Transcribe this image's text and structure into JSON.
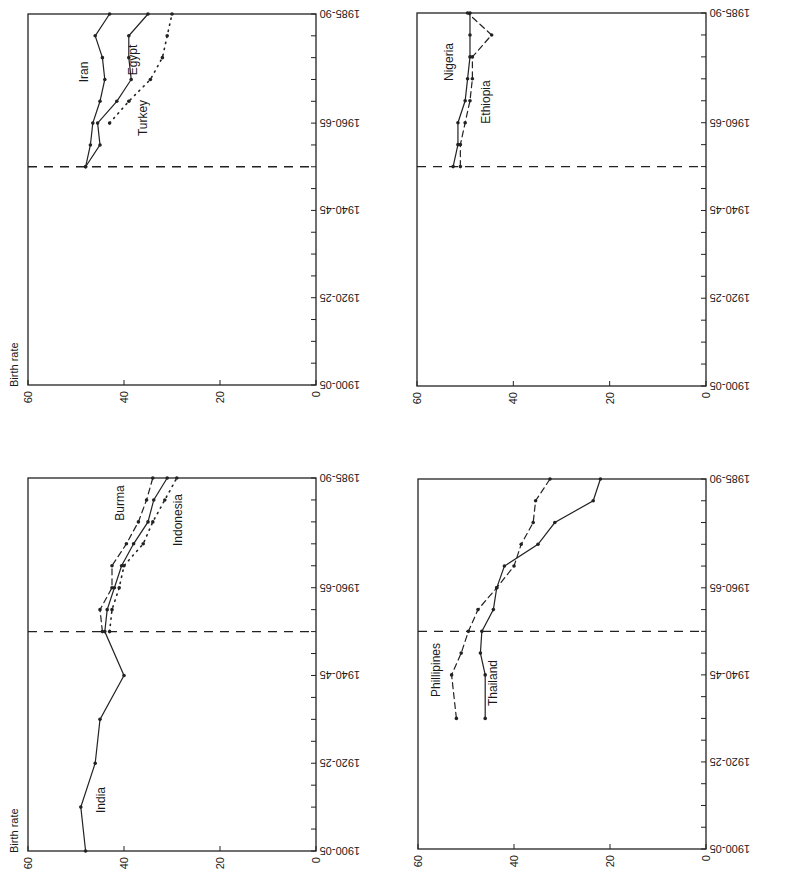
{
  "figure": {
    "orientation": "rotated 90deg (time axis vertical, 1985-90 at top; birth rate horizontal, 60 at left, 0 at right)",
    "ylabel": "Birth rate"
  },
  "chart_data": [
    {
      "type": "line",
      "panel": "top-left",
      "title": "",
      "xlabel": "",
      "ylabel": "Birth rate",
      "ylim": [
        0,
        60
      ],
      "yticks": [
        0,
        20,
        40,
        60
      ],
      "x_tick_labels": [
        "1900-05",
        "1920-25",
        "1940-45",
        "1960-65",
        "1985-90"
      ],
      "x": [
        "1900-05",
        "1905-10",
        "1910-15",
        "1915-20",
        "1920-25",
        "1925-30",
        "1930-35",
        "1935-40",
        "1940-45",
        "1945-50",
        "1950-55",
        "1955-60",
        "1960-65",
        "1965-70",
        "1970-75",
        "1975-80",
        "1980-85",
        "1985-90"
      ],
      "reference_line": "1950-55",
      "grid": false,
      "series": [
        {
          "name": "Iran",
          "style": "solid",
          "start": "1950-55",
          "values": [
            48,
            47,
            46.5,
            45,
            44,
            44.5,
            46,
            43
          ]
        },
        {
          "name": "Egypt",
          "style": "solid",
          "start": "1950-55",
          "values": [
            48,
            45,
            45.5,
            41.5,
            38.5,
            39,
            39,
            35
          ]
        },
        {
          "name": "Turkey",
          "style": "dotted",
          "start": "1960-65",
          "values": [
            43,
            39,
            34.5,
            32,
            31,
            30
          ]
        }
      ],
      "annotations": [
        {
          "text": "Iran"
        },
        {
          "text": "Egypt"
        },
        {
          "text": "Turkey"
        }
      ]
    },
    {
      "type": "line",
      "panel": "top-right",
      "title": "",
      "ylabel": "",
      "ylim": [
        0,
        60
      ],
      "yticks": [
        0,
        20,
        40,
        60
      ],
      "x_tick_labels": [
        "1900-05",
        "1920-25",
        "1940-45",
        "1960-65",
        "1985-90"
      ],
      "reference_line": "1950-55",
      "grid": false,
      "series": [
        {
          "name": "Nigeria",
          "style": "solid",
          "start": "1950-55",
          "values": [
            52.5,
            51.5,
            51.5,
            50,
            49.5,
            49,
            49,
            49
          ]
        },
        {
          "name": "Ethiopia",
          "style": "dashed",
          "start": "1950-55",
          "values": [
            51,
            51,
            50,
            49,
            48.5,
            48.5,
            44.5,
            49.5
          ]
        }
      ],
      "annotations": [
        {
          "text": "Nigeria"
        },
        {
          "text": "Ethiopia"
        }
      ]
    },
    {
      "type": "line",
      "panel": "bottom-left",
      "title": "",
      "ylabel": "Birth rate",
      "ylim": [
        0,
        60
      ],
      "yticks": [
        0,
        20,
        40,
        60
      ],
      "x_tick_labels": [
        "1900-05",
        "1920-25",
        "1940-45",
        "1960-65",
        "1985-90"
      ],
      "reference_line": "1950-55",
      "grid": false,
      "series": [
        {
          "name": "India",
          "style": "solid",
          "points": [
            [
              "1900-05",
              48
            ],
            [
              "1910-15",
              49
            ],
            [
              "1920-25",
              46
            ],
            [
              "1930-35",
              45
            ],
            [
              "1940-45",
              40
            ],
            [
              "1950-55",
              44
            ],
            [
              "1955-60",
              43.5
            ],
            [
              "1960-65",
              42
            ],
            [
              "1965-70",
              40.5
            ],
            [
              "1970-75",
              38
            ],
            [
              "1975-80",
              35
            ],
            [
              "1980-85",
              33.8
            ],
            [
              "1985-90",
              31
            ]
          ]
        },
        {
          "name": "Burma",
          "style": "dashed",
          "points": [
            [
              "1950-55",
              44.5
            ],
            [
              "1955-60",
              45
            ],
            [
              "1960-65",
              42.5
            ],
            [
              "1965-70",
              42.5
            ],
            [
              "1970-75",
              39.5
            ],
            [
              "1975-80",
              37
            ],
            [
              "1980-85",
              35.3
            ],
            [
              "1985-90",
              34
            ]
          ]
        },
        {
          "name": "Indonesia",
          "style": "dotted",
          "points": [
            [
              "1950-55",
              43
            ],
            [
              "1955-60",
              42.5
            ],
            [
              "1960-65",
              41
            ],
            [
              "1965-70",
              40
            ],
            [
              "1970-75",
              36
            ],
            [
              "1975-80",
              34
            ],
            [
              "1980-85",
              31.5
            ],
            [
              "1985-90",
              29
            ]
          ]
        }
      ],
      "annotations": [
        {
          "text": "India"
        },
        {
          "text": "Burma"
        },
        {
          "text": "Indonesia"
        }
      ]
    },
    {
      "type": "line",
      "panel": "bottom-right",
      "title": "",
      "ylabel": "",
      "ylim": [
        0,
        60
      ],
      "yticks": [
        0,
        20,
        40,
        60
      ],
      "x_tick_labels": [
        "1900-05",
        "1920-25",
        "1940-45",
        "1960-65",
        "1985-90"
      ],
      "reference_line": "1950-55",
      "grid": false,
      "series": [
        {
          "name": "Thailand",
          "style": "solid",
          "start": "1930-35",
          "points": [
            [
              "1930-35",
              46
            ],
            [
              "1940-45",
              46
            ],
            [
              "1945-50",
              47
            ],
            [
              "1950-55",
              46.7
            ],
            [
              "1955-60",
              44.3
            ],
            [
              "1960-65",
              43.6
            ],
            [
              "1965-70",
              42
            ],
            [
              "1970-75",
              35
            ],
            [
              "1975-80",
              31.5
            ],
            [
              "1980-85",
              23.5
            ],
            [
              "1985-90",
              22
            ]
          ]
        },
        {
          "name": "Phillipines",
          "style": "dashed",
          "start": "1930-35",
          "points": [
            [
              "1930-35",
              52
            ],
            [
              "1940-45",
              53
            ],
            [
              "1945-50",
              51
            ],
            [
              "1950-55",
              49.5
            ],
            [
              "1955-60",
              47.5
            ],
            [
              "1960-65",
              43.6
            ],
            [
              "1965-70",
              40
            ],
            [
              "1970-75",
              38.5
            ],
            [
              "1975-80",
              36
            ],
            [
              "1980-85",
              35.5
            ],
            [
              "1985-90",
              32.5
            ]
          ]
        }
      ],
      "annotations": [
        {
          "text": "Phillipines"
        },
        {
          "text": "Thailand"
        }
      ]
    }
  ],
  "panels": [
    {
      "id": "tl",
      "x0": 28,
      "x60": 28,
      "xzero": 316,
      "ytop": 14,
      "ybot": 385,
      "birth_rate_label": "Birth rate",
      "labels": [
        {
          "text": "Iran",
          "x": 88,
          "y": 72
        },
        {
          "text": "Egypt",
          "x": 137,
          "y": 60
        },
        {
          "text": "Turkey",
          "x": 147,
          "y": 118
        }
      ]
    },
    {
      "id": "tr",
      "x60": 417,
      "xzero": 706,
      "ytop": 13,
      "ybot": 386,
      "birth_rate_label": "",
      "labels": [
        {
          "text": "Nigeria",
          "x": 453,
          "y": 62
        },
        {
          "text": "Ethiopia",
          "x": 490,
          "y": 102
        }
      ]
    },
    {
      "id": "bl",
      "x60": 28,
      "xzero": 316,
      "ytop": 478,
      "ybot": 851,
      "birth_rate_label": "Birth rate",
      "labels": [
        {
          "text": "India",
          "x": 105,
          "y": 800
        },
        {
          "text": "Burma",
          "x": 124,
          "y": 503
        },
        {
          "text": "Indonesia",
          "x": 182,
          "y": 520
        }
      ]
    },
    {
      "id": "br",
      "x60": 418,
      "xzero": 706,
      "ytop": 479,
      "ybot": 849,
      "birth_rate_label": "",
      "labels": [
        {
          "text": "Phillipines",
          "x": 440,
          "y": 670
        },
        {
          "text": "Thailand",
          "x": 497,
          "y": 683
        }
      ]
    }
  ],
  "axis": {
    "value_ticks": [
      "60",
      "40",
      "20",
      "0"
    ],
    "time_ticks": [
      "1900-05",
      "1920-25",
      "1940-45",
      "1960-65",
      "1985-90"
    ],
    "time_tick_index": [
      0,
      4,
      8,
      12,
      17
    ]
  }
}
